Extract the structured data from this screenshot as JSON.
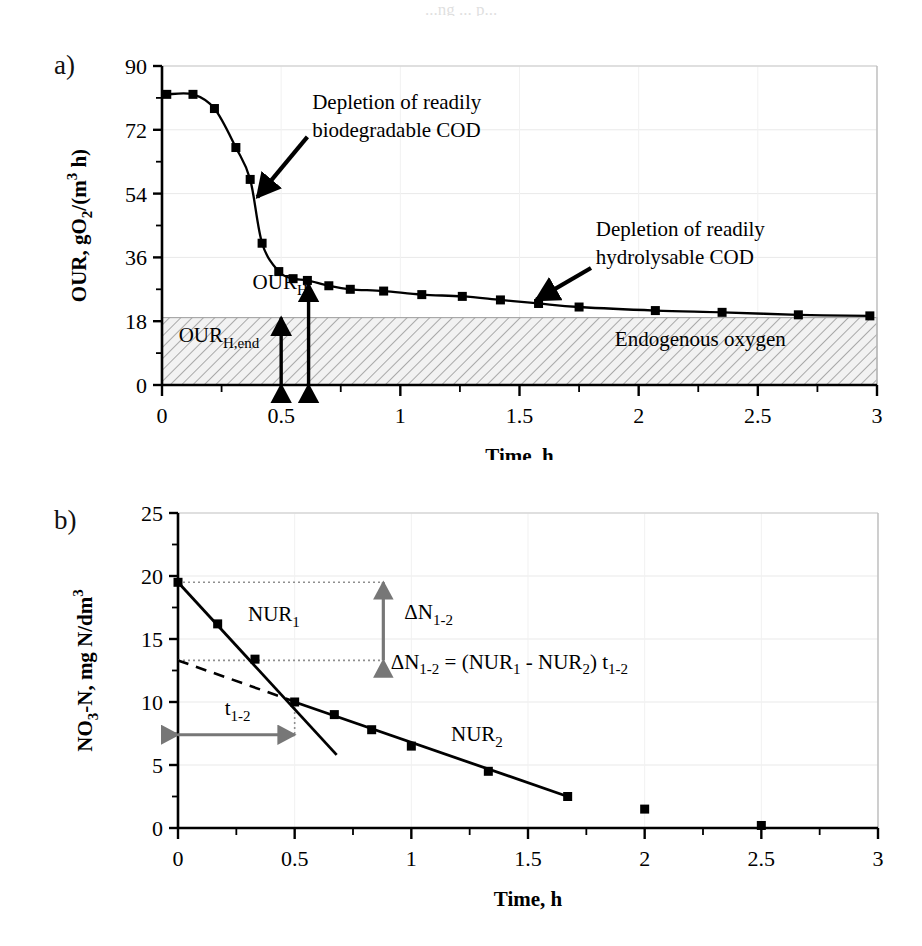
{
  "figure": {
    "background": "#ffffff",
    "top_cut_text": "...ng ... p...",
    "panels": [
      {
        "letter": "a)"
      },
      {
        "letter": "b)"
      }
    ]
  },
  "chart_data": [
    {
      "id": "panel-a",
      "panel_letter": "a)",
      "type": "line",
      "title": "",
      "xlabel": "Time, h",
      "ylabel": "OUR, gO2/(m3 h)",
      "ylabel_parts": {
        "main": "OUR, gO",
        "sub1": "2",
        "mid": "/(m",
        "sup": "3",
        "tail": " h)"
      },
      "xlim": [
        0,
        3
      ],
      "ylim": [
        0,
        90
      ],
      "xticks": [
        0,
        0.25,
        0.5,
        0.75,
        1,
        1.25,
        1.5,
        1.75,
        2,
        2.25,
        2.5,
        2.75,
        3
      ],
      "xtick_labels": [
        "0",
        "",
        "0.5",
        "",
        "1",
        "",
        "1.5",
        "",
        "2",
        "",
        "2.5",
        "",
        "3"
      ],
      "yticks": [
        0,
        9,
        18,
        27,
        36,
        45,
        54,
        63,
        72,
        81,
        90
      ],
      "ytick_labels": [
        "0",
        "",
        "18",
        "",
        "36",
        "",
        "54",
        "",
        "72",
        "",
        "90"
      ],
      "grid": true,
      "series": [
        {
          "name": "OUR",
          "marker": "square",
          "color": "#000000",
          "x": [
            0.02,
            0.13,
            0.22,
            0.31,
            0.37,
            0.42,
            0.49,
            0.55,
            0.61,
            0.7,
            0.79,
            0.93,
            1.09,
            1.26,
            1.42,
            1.58,
            1.75,
            2.07,
            2.35,
            2.67,
            2.97
          ],
          "y": [
            82.0,
            82.0,
            78.0,
            67.0,
            58.0,
            40.0,
            32.0,
            30.0,
            29.5,
            28.0,
            27.0,
            26.5,
            25.5,
            25.0,
            24.0,
            23.0,
            22.0,
            21.0,
            20.5,
            19.8,
            19.5
          ]
        }
      ],
      "shaded_region": {
        "label": "Endogenous oxygen",
        "y_from": 0,
        "y_to": 19,
        "hatch": "diagonal",
        "fill": "#f2f2f2"
      },
      "annotations": [
        {
          "name": "depletion-readily-biodegradable-cod",
          "lines": [
            "Depletion of readily",
            "biodegradable COD"
          ],
          "text_x": 0.63,
          "text_y": 78,
          "arrow_from_x": 0.61,
          "arrow_from_y": 70,
          "arrow_to_x": 0.4,
          "arrow_to_y": 53
        },
        {
          "name": "depletion-readily-hydrolysable-cod",
          "lines": [
            "Depletion of readily",
            "hydrolysable COD"
          ],
          "text_x": 1.82,
          "text_y": 42,
          "arrow_from_x": 1.8,
          "arrow_from_y": 33,
          "arrow_to_x": 1.57,
          "arrow_to_y": 24
        },
        {
          "name": "our-h-label",
          "lines": [
            "OUR"
          ],
          "subscript": "H",
          "text_x": 0.38,
          "text_y": 27
        },
        {
          "name": "our-h-end-label",
          "lines": [
            "OUR"
          ],
          "subscript": "H,end",
          "text_x": 0.07,
          "text_y": 12
        },
        {
          "name": "endogenous-oxygen-label",
          "lines": [
            "Endogenous oxygen"
          ],
          "text_x": 1.9,
          "text_y": 11
        }
      ],
      "measure_arrows": [
        {
          "name": "our-h-end-arrow",
          "x": 0.5,
          "y_from": 0,
          "y_to": 19
        },
        {
          "name": "our-h-arrow",
          "x": 0.615,
          "y_from": 0,
          "y_to": 28.5
        }
      ]
    },
    {
      "id": "panel-b",
      "panel_letter": "b)",
      "type": "scatter",
      "title": "",
      "xlabel": "Time, h",
      "ylabel": "NO3-N, mg N/dm3",
      "ylabel_parts": {
        "main": "NO",
        "sub1": "3",
        "mid": "-N, mg N/dm",
        "sup": "3",
        "tail": ""
      },
      "xlim": [
        0,
        3
      ],
      "ylim": [
        0,
        25
      ],
      "xticks": [
        0,
        0.25,
        0.5,
        0.75,
        1,
        1.25,
        1.5,
        1.75,
        2,
        2.25,
        2.5,
        2.75,
        3
      ],
      "xtick_labels": [
        "0",
        "",
        "0.5",
        "",
        "1",
        "",
        "1.5",
        "",
        "2",
        "",
        "2.5",
        "",
        "3"
      ],
      "yticks": [
        0,
        2.5,
        5,
        7.5,
        10,
        12.5,
        15,
        17.5,
        20,
        22.5,
        25
      ],
      "ytick_labels": [
        "0",
        "",
        "5",
        "",
        "10",
        "",
        "15",
        "",
        "20",
        "",
        "25"
      ],
      "grid": true,
      "series": [
        {
          "name": "NO3-N",
          "marker": "square",
          "color": "#000000",
          "x": [
            0.0,
            0.17,
            0.33,
            0.5,
            0.67,
            0.83,
            1.0,
            1.33,
            1.67,
            2.0,
            2.5
          ],
          "y": [
            19.5,
            16.2,
            13.4,
            10.0,
            9.0,
            7.8,
            6.5,
            4.5,
            2.5,
            1.5,
            0.2
          ]
        }
      ],
      "fit_lines": [
        {
          "name": "nur1-line",
          "style": "solid",
          "x1": 0.0,
          "y1": 19.5,
          "x2": 0.68,
          "y2": 5.8
        },
        {
          "name": "nur2-line",
          "style": "solid",
          "x1": 0.5,
          "y1": 10.0,
          "x2": 1.67,
          "y2": 2.5
        },
        {
          "name": "nur2-extrapolated",
          "style": "dashed",
          "x1": 0.0,
          "y1": 13.3,
          "x2": 0.52,
          "y2": 9.9
        }
      ],
      "guide_lines": [
        {
          "name": "dn-upper-guide",
          "style": "dotted",
          "x1": 0.0,
          "y1": 19.5,
          "x2": 0.88,
          "y2": 19.5
        },
        {
          "name": "dn-lower-guide",
          "style": "dotted",
          "x1": 0.0,
          "y1": 13.3,
          "x2": 0.88,
          "y2": 13.3
        },
        {
          "name": "t12-drop-guide",
          "style": "dotted",
          "x1": 0.5,
          "y1": 10.0,
          "x2": 0.5,
          "y2": 7.4
        }
      ],
      "measure_arrows": [
        {
          "name": "delta-n-1-2-arrow",
          "orientation": "vertical",
          "x": 0.88,
          "y_from": 13.3,
          "y_to": 19.5,
          "color": "#777777"
        },
        {
          "name": "t-1-2-arrow",
          "orientation": "horizontal",
          "y": 7.4,
          "x_from": 0.0,
          "x_to": 0.5,
          "color": "#777777"
        }
      ],
      "annotations": [
        {
          "name": "nur1-label",
          "lines": [
            "NUR"
          ],
          "subscript": "1",
          "text_x": 0.3,
          "text_y": 16.4
        },
        {
          "name": "nur2-label",
          "lines": [
            "NUR"
          ],
          "subscript": "2",
          "text_x": 1.17,
          "text_y": 6.9
        },
        {
          "name": "delta-n-label",
          "lines": [
            "ΔN"
          ],
          "subscript": "1-2",
          "text_x": 0.97,
          "text_y": 16.6
        },
        {
          "name": "t-1-2-label",
          "lines": [
            "t"
          ],
          "subscript": "1-2",
          "text_x": 0.2,
          "text_y": 9.0
        },
        {
          "name": "equation-label",
          "equation": "ΔN1-2 = (NUR1 - NUR2) t1-2",
          "equation_tokens": [
            {
              "t": "ΔN",
              "k": "n"
            },
            {
              "t": "1-2",
              "k": "sub"
            },
            {
              "t": " = (NUR",
              "k": "n"
            },
            {
              "t": "1",
              "k": "sub"
            },
            {
              "t": " - NUR",
              "k": "n"
            },
            {
              "t": "2",
              "k": "sub"
            },
            {
              "t": ") t",
              "k": "n"
            },
            {
              "t": "1-2",
              "k": "sub"
            }
          ],
          "text_x": 1.42,
          "text_y": 12.6
        }
      ]
    }
  ]
}
